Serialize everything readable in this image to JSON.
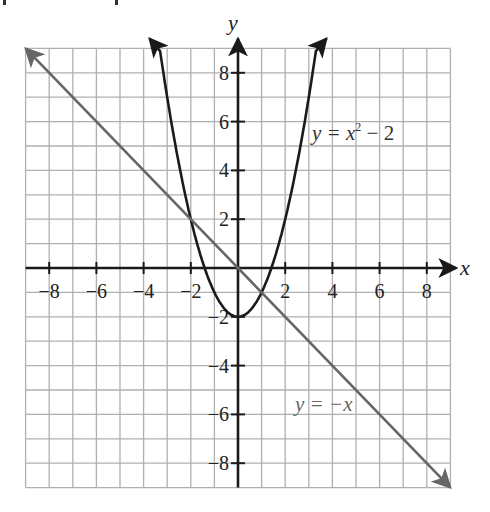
{
  "chart_data": {
    "type": "line",
    "title": "",
    "xlabel": "x",
    "ylabel": "y",
    "xlim": [
      -9,
      9
    ],
    "ylim": [
      -9,
      9
    ],
    "grid": true,
    "x_ticks": [
      -8,
      -6,
      -4,
      -2,
      2,
      4,
      6,
      8
    ],
    "y_ticks": [
      -8,
      -6,
      -4,
      -2,
      2,
      4,
      6,
      8
    ],
    "series": [
      {
        "name": "y = x² − 2",
        "label": "y = x² − 2",
        "equation": "y = x^2 - 2",
        "color": "#1a1a1a",
        "x": [
          -3.3,
          -3,
          -2,
          -1,
          0,
          1,
          2,
          3,
          3.3
        ],
        "values": [
          8.89,
          7,
          2,
          -1,
          -2,
          -1,
          2,
          7,
          8.89
        ]
      },
      {
        "name": "y = −x",
        "label": "y = −x",
        "equation": "y = -x",
        "color": "#666666",
        "x": [
          -9,
          9
        ],
        "values": [
          9,
          -9
        ]
      }
    ],
    "intersections": [
      {
        "x": -2,
        "y": 2
      },
      {
        "x": 1,
        "y": -1
      }
    ],
    "annotations": [
      {
        "text": "y = x² − 2",
        "x": 3.2,
        "y": 5.4
      },
      {
        "text": "y = −x",
        "x": 2.5,
        "y": -5.6
      }
    ]
  },
  "labels": {
    "x_axis": "x",
    "y_axis": "y",
    "parabola_label_prefix": "y = x",
    "parabola_label_exp": "2",
    "parabola_label_suffix": " − 2",
    "line_label": "y = −x"
  },
  "colors": {
    "grid": "#b0b0b0",
    "axis": "#1a1a1a",
    "parabola": "#1a1a1a",
    "line": "#666666"
  }
}
